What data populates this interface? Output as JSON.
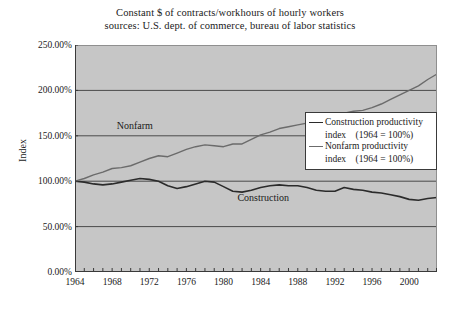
{
  "chart_data": {
    "type": "line",
    "title": "Constant $ of contracts/workhours of hourly workers",
    "subtitle": "sources: U.S. dept. of commerce, bureau of labor statistics",
    "xlabel": "",
    "ylabel": "Index",
    "xlim": [
      1964,
      2003
    ],
    "ylim": [
      0,
      250
    ],
    "ytick_labels": [
      "250.00%",
      "200.00%",
      "150.00%",
      "100.00%",
      "50.00%",
      "0.00%"
    ],
    "ytick_values": [
      250,
      200,
      150,
      100,
      50,
      0
    ],
    "xtick_labels": [
      "1964",
      "1968",
      "1972",
      "1976",
      "1980",
      "1984",
      "1988",
      "1992",
      "1996",
      "2000"
    ],
    "xtick_values": [
      1964,
      1968,
      1972,
      1976,
      1980,
      1984,
      1988,
      1992,
      1996,
      2000
    ],
    "xtick_minor_step": 1,
    "grid": "horizontal",
    "plot_background": "#c6c6c6",
    "legend_position": "center-right",
    "x": [
      1964,
      1965,
      1966,
      1967,
      1968,
      1969,
      1970,
      1971,
      1972,
      1973,
      1974,
      1975,
      1976,
      1977,
      1978,
      1979,
      1980,
      1981,
      1982,
      1983,
      1984,
      1985,
      1986,
      1987,
      1988,
      1989,
      1990,
      1991,
      1992,
      1993,
      1994,
      1995,
      1996,
      1997,
      1998,
      1999,
      2000,
      2001,
      2002,
      2003
    ],
    "series": [
      {
        "name": "Construction productivity index   (1964 = 100%)",
        "short_name": "Construction",
        "color": "#2b2b2b",
        "width": 1.6,
        "values": [
          100,
          99,
          97,
          96,
          97,
          99,
          101,
          103,
          102,
          100,
          95,
          92,
          94,
          97,
          100,
          99,
          94,
          89,
          88,
          90,
          93,
          95,
          96,
          95,
          95,
          93,
          90,
          89,
          89,
          93,
          91,
          90,
          88,
          87,
          85,
          83,
          80,
          79,
          81,
          82
        ]
      },
      {
        "name": "Nonfarm productivity index   (1964 = 100%)",
        "short_name": "Nonfarm",
        "color": "#6b6b6b",
        "width": 1.4,
        "values": [
          100,
          103,
          107,
          110,
          114,
          115,
          117,
          121,
          125,
          128,
          127,
          131,
          135,
          138,
          140,
          139,
          138,
          141,
          141,
          146,
          151,
          154,
          158,
          160,
          162,
          164,
          166,
          168,
          174,
          175,
          177,
          178,
          181,
          185,
          190,
          195,
          200,
          205,
          212,
          218
        ]
      }
    ],
    "annotations": [
      {
        "text": "Nonfarm",
        "x": 1968.5,
        "y": 160
      },
      {
        "text": "Construction",
        "x": 1981.5,
        "y": 82
      }
    ]
  },
  "legend": {
    "entries": [
      {
        "line1": "Construction productivity",
        "line2": "index    (1964 = 100%)",
        "color": "#2b2b2b"
      },
      {
        "line1": "Nonfarm productivity",
        "line2": "index    (1964 = 100%)",
        "color": "#6b6b6b"
      }
    ]
  }
}
